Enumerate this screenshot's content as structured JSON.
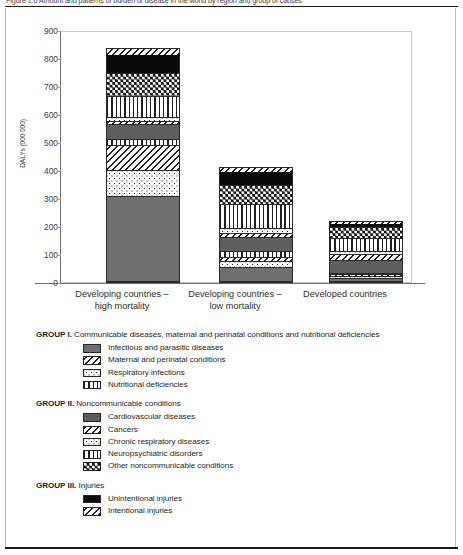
{
  "figure": {
    "caption": "Figure 1.6 Amount and patterns of burden of disease in the world by region and group of causes"
  },
  "chart_data": {
    "type": "bar",
    "stacked": true,
    "title": "",
    "xlabel": "",
    "ylabel": "DALYs (000 000)",
    "ylim": [
      0,
      900
    ],
    "yticks": [
      0,
      100,
      200,
      300,
      400,
      500,
      600,
      700,
      800,
      900
    ],
    "grid": false,
    "legend_position": "below",
    "categories": [
      "Developing countries – high mortality",
      "Developing countries – low mortality",
      "Developed countries"
    ],
    "category_lines": [
      [
        "Developing countries –",
        "high mortality"
      ],
      [
        "Developing countries –",
        "low mortality"
      ],
      [
        "Developed countries"
      ]
    ],
    "series": [
      {
        "name": "Infectious and parasitic diseases",
        "group": "GROUP I",
        "pattern": "solid-gray",
        "values": [
          305,
          52,
          10
        ]
      },
      {
        "name": "Respiratory infections",
        "group": "GROUP I",
        "pattern": "dotted",
        "values": [
          95,
          20,
          8
        ]
      },
      {
        "name": "Maternal and perinatal conditions",
        "group": "GROUP I",
        "pattern": "diagonal-hatch",
        "values": [
          90,
          16,
          7
        ]
      },
      {
        "name": "Nutritional deficiencies",
        "group": "GROUP I",
        "pattern": "vertical-lines",
        "values": [
          20,
          20,
          5
        ]
      },
      {
        "name": "Cardiovascular diseases",
        "group": "GROUP II",
        "pattern": "dark-gray",
        "values": [
          55,
          52,
          48
        ]
      },
      {
        "name": "Cancers",
        "group": "GROUP II",
        "pattern": "diagonal-hatch",
        "values": [
          12,
          15,
          22
        ]
      },
      {
        "name": "Chronic respiratory diseases",
        "group": "GROUP II",
        "pattern": "dotted",
        "values": [
          15,
          17,
          12
        ]
      },
      {
        "name": "Neuropsychiatric disorders",
        "group": "GROUP II",
        "pattern": "vertical-lines",
        "values": [
          76,
          88,
          48
        ]
      },
      {
        "name": "Other noncommunicable conditions",
        "group": "GROUP II",
        "pattern": "checker",
        "values": [
          80,
          70,
          38
        ]
      },
      {
        "name": "Unintentional injuries",
        "group": "GROUP III",
        "pattern": "black",
        "values": [
          70,
          48,
          17
        ]
      },
      {
        "name": "Intentional injuries",
        "group": "GROUP III",
        "pattern": "diagonal-hatch",
        "values": [
          20,
          17,
          7
        ]
      }
    ],
    "totals": [
      838,
      415,
      222
    ]
  },
  "legend": {
    "groups": [
      {
        "label": "GROUP I.",
        "title": "Communicable diseases, maternal and perinatal conditions and nutritional deficiencies",
        "items": [
          {
            "label": "Infectious and parasitic diseases",
            "pattern": "solid-gray"
          },
          {
            "label": "Maternal and perinatal conditions",
            "pattern": "diagonal-hatch"
          },
          {
            "label": "Respiratory infections",
            "pattern": "dotted"
          },
          {
            "label": "Nutritional deficiencies",
            "pattern": "vertical-lines"
          }
        ]
      },
      {
        "label": "GROUP II.",
        "title": "Noncommunicable conditions",
        "items": [
          {
            "label": "Cardiovascular diseases",
            "pattern": "dark-gray"
          },
          {
            "label": "Cancers",
            "pattern": "diagonal-hatch"
          },
          {
            "label": "Chronic respiratory diseases",
            "pattern": "dotted"
          },
          {
            "label": "Neuropsychiatric disorders",
            "pattern": "vertical-lines"
          },
          {
            "label": "Other noncommunicable conditions",
            "pattern": "checker"
          }
        ]
      },
      {
        "label": "GROUP III.",
        "title": "Injuries",
        "items": [
          {
            "label": "Unintentional injuries",
            "pattern": "black"
          },
          {
            "label": "Intentional injuries",
            "pattern": "diagonal-hatch"
          }
        ]
      }
    ]
  },
  "colors": {
    "ink": "#231f20",
    "solid_gray": "#6f6f6f",
    "dark_gray": "#5e5e5e",
    "black": "#0a0a0a",
    "frame": "#c9c9c9",
    "axis": "#6f6f6f"
  }
}
